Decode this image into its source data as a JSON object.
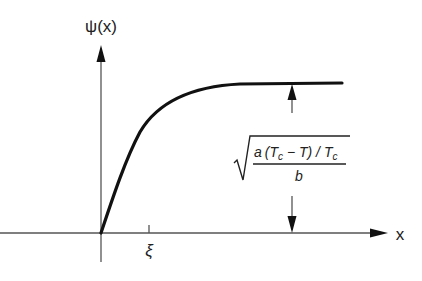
{
  "diagram": {
    "y_axis_label": "ψ(x)",
    "x_axis_label": "x",
    "tick_label": "ξ",
    "formula": {
      "numerator_a": "a",
      "numerator_open": "(",
      "T": "T",
      "c": "c",
      "minus": " − ",
      "T2": "T",
      "close_slash": ") / ",
      "T3": "T",
      "c2": "c",
      "denominator": "b"
    },
    "colors": {
      "axis": "#555555",
      "curve": "#111111",
      "text": "#222222"
    }
  }
}
